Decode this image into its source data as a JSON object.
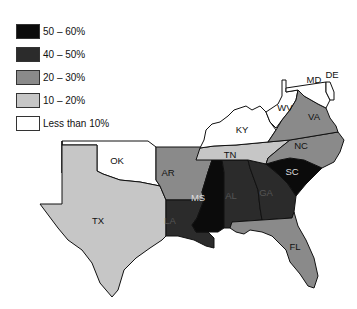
{
  "legend": {
    "items": [
      {
        "label": "50 – 60%",
        "color": "#0b0b0b"
      },
      {
        "label": "40 – 50%",
        "color": "#2b2b2b"
      },
      {
        "label": "20 – 30%",
        "color": "#8a8a8a"
      },
      {
        "label": "10 – 20%",
        "color": "#c6c6c6"
      },
      {
        "label": "Less than 10%",
        "color": "#ffffff"
      }
    ]
  },
  "states": [
    {
      "abbr": "TX",
      "category": "10 – 20%"
    },
    {
      "abbr": "OK",
      "category": "Less than 10%"
    },
    {
      "abbr": "AR",
      "category": "20 – 30%"
    },
    {
      "abbr": "LA",
      "category": "40 – 50%"
    },
    {
      "abbr": "MS",
      "category": "50 – 60%"
    },
    {
      "abbr": "AL",
      "category": "40 – 50%"
    },
    {
      "abbr": "GA",
      "category": "40 – 50%"
    },
    {
      "abbr": "SC",
      "category": "50 – 60%"
    },
    {
      "abbr": "FL",
      "category": "20 – 30%"
    },
    {
      "abbr": "TN",
      "category": "10 – 20%"
    },
    {
      "abbr": "KY",
      "category": "Less than 10%"
    },
    {
      "abbr": "NC",
      "category": "20 – 30%"
    },
    {
      "abbr": "VA",
      "category": "20 – 30%"
    },
    {
      "abbr": "WV",
      "category": "Less than 10%"
    },
    {
      "abbr": "MD",
      "category": "Less than 10%"
    },
    {
      "abbr": "DE",
      "category": "Less than 10%"
    }
  ]
}
